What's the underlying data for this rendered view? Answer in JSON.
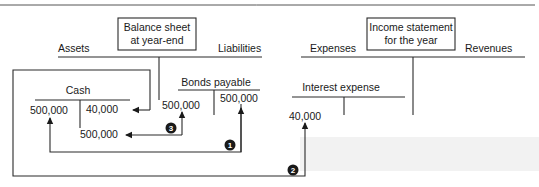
{
  "balance_sheet": {
    "title_line1": "Balance sheet",
    "title_line2": "at year-end",
    "left_label": "Assets",
    "right_label": "Liabilities"
  },
  "income_statement": {
    "title_line1": "Income statement",
    "title_line2": "for the year",
    "left_label": "Expenses",
    "right_label": "Revenues"
  },
  "accounts": {
    "cash": {
      "name": "Cash",
      "debit": "500,000",
      "credit": "40,000",
      "debit_below": "500,000"
    },
    "bonds_payable": {
      "name": "Bonds payable",
      "debit": "500,000",
      "credit": "500,000"
    },
    "interest_expense": {
      "name": "Interest expense",
      "debit": "40,000"
    }
  },
  "flows": [
    {
      "step": "1",
      "description": "Bond issue: Cash debit 500,000 from Bonds payable credit 500,000"
    },
    {
      "step": "2",
      "description": "Interest paid: Interest expense debit 40,000 from Cash credit 40,000"
    },
    {
      "step": "3",
      "description": "Bond repayment: Bonds payable debit 500,000 from Cash credit 500,000"
    }
  ],
  "colors": {
    "line": "#2a2a2a",
    "badge": "#1a1a1a",
    "band": "#f2f2f2"
  }
}
